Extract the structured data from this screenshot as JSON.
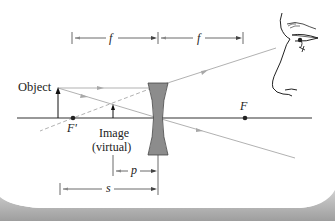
{
  "diagram": {
    "type": "ray-diagram",
    "labels": {
      "object": "Object",
      "image_line1": "Image",
      "image_line2": "(virtual)",
      "focal_left": "F'",
      "focal_right": "F",
      "f_left": "f",
      "f_right": "f",
      "p": "p",
      "s": "s"
    },
    "colors": {
      "axis": "#333333",
      "ray": "#a8a8a8",
      "lens_fill": "#8c8c8c",
      "lens_stroke": "#444444",
      "dimension": "#444444",
      "shadow": "#b5b5b5"
    }
  }
}
